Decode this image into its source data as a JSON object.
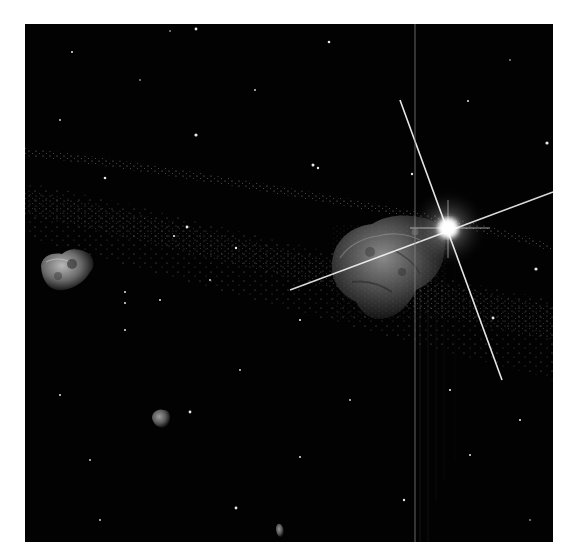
{
  "scene": {
    "description": "Asteroid field in deep space with a bright star showing diffraction spikes",
    "background_color": "#020202",
    "frame_color": "#ffffff",
    "elements": [
      {
        "type": "large-asteroid",
        "center": [
          385,
          240
        ]
      },
      {
        "type": "bright-star",
        "center": [
          448,
          228
        ]
      },
      {
        "type": "small-asteroid",
        "center": [
          66,
          270
        ]
      },
      {
        "type": "small-asteroid",
        "center": [
          160,
          420
        ]
      },
      {
        "type": "tiny-asteroid",
        "center": [
          280,
          530
        ]
      },
      {
        "type": "dust-band-upper",
        "from": [
          30,
          148
        ],
        "to": [
          552,
          245
        ]
      },
      {
        "type": "dust-band-lower",
        "from": [
          30,
          190
        ],
        "to": [
          552,
          340
        ]
      },
      {
        "type": "vertical-artifact-line",
        "x": 415
      }
    ]
  }
}
